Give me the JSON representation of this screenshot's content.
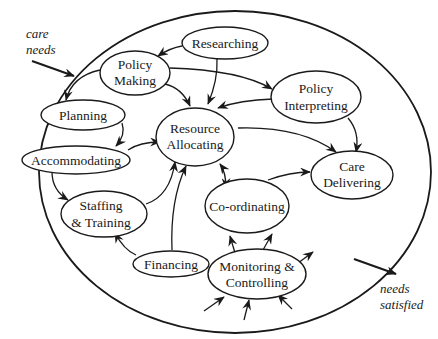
{
  "diagram": {
    "type": "process-system-diagram",
    "boundary": {
      "shape": "ellipse"
    },
    "inputs": [
      {
        "id": "care_needs",
        "label_lines": [
          "care",
          "needs"
        ]
      }
    ],
    "outputs": [
      {
        "id": "needs_satisfied",
        "label_lines": [
          "needs",
          "satisfied"
        ]
      }
    ],
    "nodes": [
      {
        "id": "researching",
        "label_lines": [
          "Researching"
        ]
      },
      {
        "id": "policy_making",
        "label_lines": [
          "Policy",
          "Making"
        ]
      },
      {
        "id": "policy_interpreting",
        "label_lines": [
          "Policy",
          "Interpreting"
        ]
      },
      {
        "id": "planning",
        "label_lines": [
          "Planning"
        ]
      },
      {
        "id": "resource_allocating",
        "label_lines": [
          "Resource",
          "Allocating"
        ]
      },
      {
        "id": "accommodating",
        "label_lines": [
          "Accommodating"
        ]
      },
      {
        "id": "care_delivering",
        "label_lines": [
          "Care",
          "Delivering"
        ]
      },
      {
        "id": "staffing_training",
        "label_lines": [
          "Staffing",
          "& Training"
        ]
      },
      {
        "id": "co_ordinating",
        "label_lines": [
          "Co-ordinating"
        ]
      },
      {
        "id": "financing",
        "label_lines": [
          "Financing"
        ]
      },
      {
        "id": "monitoring_controlling",
        "label_lines": [
          "Monitoring &",
          "Controlling"
        ]
      }
    ],
    "edges": [
      {
        "from": "researching",
        "to": "policy_making"
      },
      {
        "from": "researching",
        "to": "resource_allocating"
      },
      {
        "from": "policy_making",
        "to": "planning"
      },
      {
        "from": "policy_making",
        "to": "resource_allocating"
      },
      {
        "from": "policy_making",
        "to": "policy_interpreting"
      },
      {
        "from": "policy_interpreting",
        "to": "resource_allocating"
      },
      {
        "from": "policy_interpreting",
        "to": "care_delivering"
      },
      {
        "from": "planning",
        "to": "accommodating"
      },
      {
        "from": "accommodating",
        "to": "resource_allocating"
      },
      {
        "from": "accommodating",
        "to": "staffing_training"
      },
      {
        "from": "staffing_training",
        "to": "resource_allocating"
      },
      {
        "from": "financing",
        "to": "staffing_training"
      },
      {
        "from": "financing",
        "to": "resource_allocating"
      },
      {
        "from": "resource_allocating",
        "to": "care_delivering"
      },
      {
        "from": "resource_allocating",
        "to": "co_ordinating",
        "bidirectional": true
      },
      {
        "from": "co_ordinating",
        "to": "care_delivering"
      },
      {
        "from": "monitoring_controlling",
        "to": "co_ordinating",
        "count": 2
      },
      {
        "from": "monitoring_controlling",
        "to": "outward",
        "count": 1
      },
      {
        "from": "inward",
        "to": "monitoring_controlling",
        "count": 3
      },
      {
        "from": "care_needs",
        "to": "boundary"
      },
      {
        "from": "boundary",
        "to": "needs_satisfied"
      }
    ]
  }
}
